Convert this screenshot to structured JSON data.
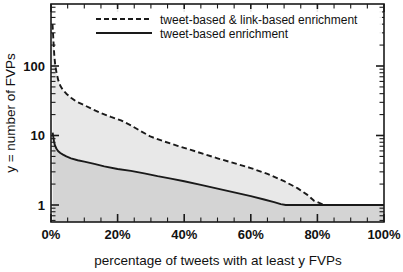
{
  "chart_data": {
    "type": "line",
    "title": "",
    "xlabel": "percentage of tweets with at least y FVPs",
    "ylabel": "y = number of FVPs",
    "yscale": "log",
    "xlim": [
      0,
      100
    ],
    "ylim": [
      0.72,
      480
    ],
    "grid": false,
    "legend_position": "top-center",
    "xticks": [
      "0%",
      "20%",
      "40%",
      "60%",
      "80%",
      "100%"
    ],
    "xtick_values": [
      0,
      20,
      40,
      60,
      80,
      100
    ],
    "yticks": [
      "1",
      "10",
      "100"
    ],
    "ytick_values": [
      1,
      10,
      100
    ],
    "series": [
      {
        "name": "tweet-based & link-based enrichment",
        "style": "dashed",
        "color": "#1a1a1a",
        "x": [
          0.45,
          0.6,
          0.8,
          1.0,
          1.3,
          1.7,
          2.2,
          2.8,
          3.6,
          4.6,
          6.0,
          7.5,
          9.5,
          12.0,
          15.0,
          18.0,
          21.0,
          24.0,
          27.0,
          30.0,
          34.0,
          38.0,
          42.0,
          46.0,
          50.0,
          55.0,
          60.0,
          65.0,
          70.0,
          74.0,
          77.0,
          79.0,
          82.0,
          88.0,
          94.0,
          100.0
        ],
        "y": [
          400.0,
          300.0,
          200.0,
          140.0,
          100.0,
          78.0,
          62.0,
          52.0,
          45.0,
          40.0,
          35.0,
          31.0,
          28.0,
          24.5,
          21.0,
          18.5,
          16.5,
          14.0,
          11.5,
          9.6,
          8.2,
          7.1,
          6.2,
          5.4,
          4.7,
          4.0,
          3.4,
          2.8,
          2.2,
          1.75,
          1.4,
          1.15,
          1.0,
          1.0,
          1.0,
          1.0
        ]
      },
      {
        "name": "tweet-based enrichment",
        "style": "solid",
        "color": "#1a1a1a",
        "x": [
          0.5,
          0.7,
          0.9,
          1.2,
          1.6,
          2.1,
          2.8,
          3.6,
          4.6,
          6.0,
          8.0,
          10.0,
          13.0,
          16.0,
          20.0,
          24.0,
          28.0,
          32.0,
          36.0,
          40.0,
          45.0,
          50.0,
          55.0,
          60.0,
          64.0,
          67.0,
          69.0,
          70.5,
          75.0,
          82.0,
          90.0,
          100.0
        ],
        "y": [
          11.0,
          9.5,
          8.2,
          7.2,
          6.5,
          6.0,
          5.6,
          5.3,
          5.0,
          4.7,
          4.4,
          4.2,
          3.9,
          3.6,
          3.3,
          3.1,
          2.85,
          2.6,
          2.4,
          2.2,
          1.95,
          1.72,
          1.52,
          1.34,
          1.2,
          1.1,
          1.03,
          1.0,
          1.0,
          1.0,
          1.0,
          1.0
        ]
      }
    ],
    "fills": [
      {
        "name": "band-between-curves",
        "color": "#e8e8e8"
      },
      {
        "name": "band-under-solid",
        "color": "#d4d4d4"
      }
    ]
  },
  "legend": {
    "entries": [
      {
        "label": "tweet-based & link-based enrichment",
        "style": "dashed"
      },
      {
        "label": "tweet-based enrichment",
        "style": "solid"
      }
    ]
  },
  "axes": {
    "x_title": "percentage of tweets with at least y FVPs",
    "y_title": "y = number of FVPs",
    "x_tick_labels": [
      "0%",
      "20%",
      "40%",
      "60%",
      "80%",
      "100%"
    ],
    "y_tick_labels": [
      "100",
      "10",
      "1"
    ]
  }
}
